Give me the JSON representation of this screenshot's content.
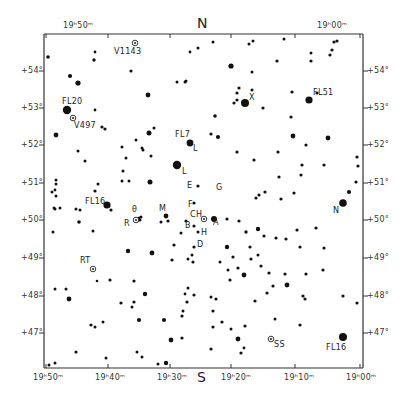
{
  "chart_data": {
    "type": "scatter",
    "frame": {
      "left": 44,
      "top": 34,
      "right": 363,
      "bottom": 368
    },
    "orientation": {
      "north": "N",
      "south": "S"
    },
    "ra_axis": {
      "label_top": [
        "19h50m",
        "19h00m"
      ],
      "ticks": [
        {
          "label": "19ʰ50ᵐ",
          "x": 46
        },
        {
          "label": "19ʰ40ᵐ",
          "x": 108
        },
        {
          "label": "19ʰ30ᵐ",
          "x": 170
        },
        {
          "label": "19ʰ20ᵐ",
          "x": 231
        },
        {
          "label": "19ʰ10ᵐ",
          "x": 295
        },
        {
          "label": "19ʰ00ᵐ",
          "x": 360
        }
      ]
    },
    "dec_axis": {
      "ticks": [
        {
          "label": "+54°",
          "y": 71
        },
        {
          "label": "+53°",
          "y": 108
        },
        {
          "label": "+52°",
          "y": 145
        },
        {
          "label": "+51°",
          "y": 183
        },
        {
          "label": "+50°",
          "y": 220
        },
        {
          "label": "+49°",
          "y": 258
        },
        {
          "label": "+48°",
          "y": 296
        },
        {
          "label": "+47°",
          "y": 333
        }
      ]
    },
    "labeled_objects": [
      {
        "name": "V1143",
        "type": "variable",
        "x": 135,
        "y": 43
      },
      {
        "name": "FL20",
        "type": "star",
        "x": 67,
        "y": 110
      },
      {
        "name": "V497",
        "type": "variable",
        "x": 73,
        "y": 118
      },
      {
        "name": "X",
        "type": "star",
        "x": 245,
        "y": 103
      },
      {
        "name": "FL51",
        "type": "star",
        "x": 309,
        "y": 100
      },
      {
        "name": "FL7",
        "type": "star",
        "x": 190,
        "y": 143
      },
      {
        "name": "L",
        "type": "star",
        "x": 177,
        "y": 165
      },
      {
        "name": "FL16",
        "type": "star",
        "x": 107,
        "y": 205
      },
      {
        "name": "E",
        "type": "star",
        "x": 195,
        "y": 183
      },
      {
        "name": "G",
        "type": "star",
        "x": 213,
        "y": 191
      },
      {
        "name": "θ",
        "type": "star",
        "x": 136,
        "y": 218
      },
      {
        "name": "R",
        "type": "variable",
        "x": 133,
        "y": 220
      },
      {
        "name": "M",
        "type": "star",
        "x": 166,
        "y": 216
      },
      {
        "name": "F",
        "type": "star",
        "x": 195,
        "y": 207
      },
      {
        "name": "CH",
        "type": "variable",
        "x": 204,
        "y": 219
      },
      {
        "name": "A",
        "type": "star",
        "x": 211,
        "y": 219
      },
      {
        "name": "B",
        "type": "star",
        "x": 192,
        "y": 223
      },
      {
        "name": "H",
        "type": "star",
        "x": 200,
        "y": 230
      },
      {
        "name": "D",
        "type": "star",
        "x": 194,
        "y": 248
      },
      {
        "name": "N",
        "type": "star",
        "x": 343,
        "y": 203
      },
      {
        "name": "RT",
        "type": "variable",
        "x": 93,
        "y": 269
      },
      {
        "name": "SS",
        "type": "variable",
        "x": 271,
        "y": 339
      },
      {
        "name": "FL16",
        "type": "star",
        "x": 343,
        "y": 337
      }
    ]
  },
  "labels": {
    "top_left_ra": "19ʰ50ᵐ",
    "top_right_ra": "19ʰ00ᵐ",
    "north": "N",
    "south": "S",
    "v1143": "V1143",
    "fl20": "FL20",
    "v497": "V497",
    "x": "X",
    "fl51": "FL51",
    "fl7": "FL7",
    "l1": "L",
    "l2": "L",
    "fl16_left": "FL16",
    "e": "E",
    "g": "G",
    "theta": "θ",
    "r": "R",
    "m": "M",
    "f": "F",
    "ch": "CH",
    "a": "A",
    "b": "B",
    "h": "H",
    "d": "D",
    "n": "N",
    "rt": "RT",
    "ss": "SS",
    "fl16_right": "FL16",
    "dec_left": [
      "+54°",
      "+53°",
      "+52°",
      "+51°",
      "+50°",
      "+49°",
      "+48°",
      "+47°"
    ],
    "dec_right": [
      "+54°",
      "+53°",
      "+52°",
      "+51°",
      "+50°",
      "+49°",
      "+48°",
      "+47°"
    ],
    "ra_bottom": [
      "19ʰ50ᵐ",
      "19ʰ40ᵐ",
      "19ʰ30ᵐ",
      "19ʰ20ᵐ",
      "19ʰ10ᵐ",
      "19ʰ00ᵐ"
    ]
  },
  "stars": [
    [
      48,
      57,
      1.8
    ],
    [
      95,
      52,
      1.4
    ],
    [
      94,
      60,
      1.7
    ],
    [
      70,
      76,
      2.1
    ],
    [
      78,
      83,
      2.6
    ],
    [
      95,
      110,
      1.4
    ],
    [
      56,
      135,
      2.4
    ],
    [
      102,
      127,
      1.6
    ],
    [
      105,
      129,
      1.6
    ],
    [
      149,
      133,
      2.5
    ],
    [
      154,
      128,
      1.5
    ],
    [
      131,
      71,
      1.6
    ],
    [
      186,
      81,
      1.5
    ],
    [
      190,
      52,
      1.4
    ],
    [
      198,
      48,
      1.5
    ],
    [
      177,
      82,
      1.5
    ],
    [
      185,
      82,
      1.5
    ],
    [
      148,
      95,
      2.4
    ],
    [
      213,
      42,
      1.5
    ],
    [
      249,
      44,
      1.5
    ],
    [
      252,
      72,
      1.5
    ],
    [
      239,
      88,
      1.6
    ],
    [
      231,
      66,
      2.6
    ],
    [
      237,
      93,
      1.6
    ],
    [
      234,
      103,
      1.6
    ],
    [
      237,
      100,
      1.6
    ],
    [
      263,
      108,
      1.6
    ],
    [
      252,
      90,
      1.5
    ],
    [
      215,
      116,
      1.8
    ],
    [
      211,
      134,
      1.6
    ],
    [
      292,
      92,
      1.6
    ],
    [
      291,
      117,
      1.6
    ],
    [
      311,
      53,
      1.5
    ],
    [
      317,
      93,
      1.6
    ],
    [
      332,
      50,
      1.6
    ],
    [
      334,
      42,
      1.6
    ],
    [
      337,
      41,
      1.6
    ],
    [
      330,
      55,
      1.6
    ],
    [
      311,
      61,
      1.6
    ],
    [
      277,
      61,
      1.6
    ],
    [
      284,
      39,
      1.5
    ],
    [
      253,
      41,
      1.5
    ],
    [
      218,
      137,
      2.1
    ],
    [
      293,
      136,
      2.4
    ],
    [
      328,
      138,
      2.4
    ],
    [
      306,
      145,
      1.6
    ],
    [
      278,
      152,
      1.6
    ],
    [
      302,
      165,
      1.6
    ],
    [
      301,
      175,
      1.6
    ],
    [
      324,
      165,
      1.6
    ],
    [
      357,
      157,
      1.6
    ],
    [
      358,
      166,
      1.6
    ],
    [
      356,
      182,
      1.6
    ],
    [
      349,
      192,
      2.1
    ],
    [
      279,
      177,
      1.6
    ],
    [
      281,
      199,
      1.6
    ],
    [
      294,
      193,
      1.6
    ],
    [
      259,
      195,
      1.6
    ],
    [
      265,
      192,
      1.6
    ],
    [
      256,
      198,
      1.6
    ],
    [
      254,
      160,
      1.6
    ],
    [
      237,
      152,
      1.6
    ],
    [
      56,
      180,
      1.5
    ],
    [
      56,
      184,
      1.5
    ],
    [
      55,
      190,
      1.4
    ],
    [
      56,
      196,
      1.5
    ],
    [
      54,
      208,
      1.5
    ],
    [
      52,
      192,
      1.5
    ],
    [
      55,
      209,
      1.5
    ],
    [
      53,
      232,
      1.5
    ],
    [
      60,
      208,
      1.5
    ],
    [
      76,
      209,
      1.5
    ],
    [
      80,
      210,
      1.5
    ],
    [
      79,
      222,
      1.8
    ],
    [
      93,
      231,
      1.5
    ],
    [
      98,
      184,
      1.5
    ],
    [
      95,
      191,
      1.6
    ],
    [
      111,
      210,
      1.6
    ],
    [
      122,
      181,
      1.5
    ],
    [
      129,
      181,
      1.5
    ],
    [
      123,
      171,
      1.5
    ],
    [
      85,
      161,
      1.5
    ],
    [
      78,
      151,
      1.5
    ],
    [
      122,
      147,
      1.5
    ],
    [
      126,
      158,
      1.5
    ],
    [
      136,
      140,
      1.5
    ],
    [
      143,
      150,
      1.5
    ],
    [
      151,
      156,
      1.5
    ],
    [
      142,
      148,
      1.5
    ],
    [
      150,
      182,
      2.5
    ],
    [
      137,
      220,
      2.4
    ],
    [
      139,
      218,
      1.5
    ],
    [
      141,
      217,
      1.5
    ],
    [
      140,
      220,
      1.5
    ],
    [
      161,
      222,
      1.5
    ],
    [
      166,
      216,
      2.4
    ],
    [
      168,
      221,
      1.6
    ],
    [
      174,
      245,
      1.6
    ],
    [
      181,
      233,
      1.5
    ],
    [
      186,
      221,
      1.6
    ],
    [
      194,
      226,
      1.6
    ],
    [
      198,
      232,
      1.5
    ],
    [
      198,
      186,
      1.6
    ],
    [
      194,
      203,
      1.6
    ],
    [
      194,
      247,
      1.6
    ],
    [
      192,
      255,
      1.5
    ],
    [
      128,
      251,
      2.2
    ],
    [
      152,
      253,
      2.4
    ],
    [
      172,
      260,
      1.6
    ],
    [
      188,
      259,
      1.5
    ],
    [
      227,
      219,
      1.6
    ],
    [
      239,
      221,
      1.6
    ],
    [
      246,
      232,
      1.7
    ],
    [
      258,
      229,
      2.2
    ],
    [
      264,
      236,
      1.6
    ],
    [
      276,
      238,
      1.6
    ],
    [
      286,
      239,
      1.6
    ],
    [
      297,
      230,
      1.6
    ],
    [
      316,
      228,
      1.6
    ],
    [
      324,
      248,
      1.6
    ],
    [
      300,
      247,
      1.6
    ],
    [
      250,
      247,
      1.6
    ],
    [
      251,
      259,
      1.6
    ],
    [
      227,
      247,
      2.2
    ],
    [
      233,
      257,
      1.6
    ],
    [
      220,
      262,
      1.5
    ],
    [
      238,
      268,
      1.6
    ],
    [
      261,
      266,
      1.6
    ],
    [
      258,
      255,
      1.5
    ],
    [
      228,
      270,
      1.5
    ],
    [
      230,
      280,
      1.6
    ],
    [
      244,
      275,
      2.4
    ],
    [
      269,
      273,
      1.6
    ],
    [
      273,
      286,
      1.6
    ],
    [
      285,
      274,
      1.6
    ],
    [
      306,
      274,
      1.6
    ],
    [
      323,
      270,
      1.6
    ],
    [
      343,
      296,
      1.6
    ],
    [
      357,
      303,
      1.6
    ],
    [
      287,
      285,
      2.4
    ],
    [
      303,
      296,
      1.6
    ],
    [
      305,
      299,
      1.6
    ],
    [
      255,
      301,
      1.6
    ],
    [
      55,
      289,
      1.5
    ],
    [
      66,
      289,
      1.5
    ],
    [
      97,
      281,
      1.3
    ],
    [
      110,
      280,
      1.6
    ],
    [
      134,
      281,
      1.6
    ],
    [
      145,
      294,
      2.2
    ],
    [
      134,
      302,
      1.6
    ],
    [
      132,
      307,
      1.5
    ],
    [
      121,
      303,
      1.6
    ],
    [
      69,
      299,
      2.4
    ],
    [
      91,
      325,
      1.6
    ],
    [
      95,
      327,
      1.5
    ],
    [
      103,
      322,
      1.5
    ],
    [
      139,
      320,
      2.1
    ],
    [
      164,
      320,
      2.1
    ],
    [
      182,
      316,
      1.6
    ],
    [
      183,
      311,
      1.5
    ],
    [
      187,
      302,
      1.6
    ],
    [
      188,
      288,
      1.5
    ],
    [
      194,
      295,
      1.6
    ],
    [
      185,
      294,
      1.4
    ],
    [
      193,
      262,
      1.6
    ],
    [
      182,
      338,
      1.6
    ],
    [
      171,
      340,
      2.4
    ],
    [
      213,
      327,
      1.6
    ],
    [
      231,
      329,
      1.5
    ],
    [
      238,
      339,
      2.4
    ],
    [
      213,
      311,
      1.6
    ],
    [
      211,
      297,
      1.5
    ],
    [
      216,
      299,
      1.6
    ],
    [
      222,
      322,
      1.6
    ],
    [
      245,
      326,
      1.6
    ],
    [
      275,
      319,
      1.5
    ],
    [
      300,
      325,
      1.6
    ],
    [
      211,
      349,
      1.6
    ],
    [
      241,
      353,
      1.6
    ],
    [
      76,
      352,
      1.6
    ],
    [
      106,
      358,
      1.5
    ],
    [
      137,
      352,
      1.5
    ],
    [
      142,
      357,
      1.5
    ],
    [
      166,
      363,
      2.2
    ],
    [
      158,
      364,
      1.5
    ],
    [
      244,
      348,
      1.4
    ],
    [
      55,
      363,
      1.5
    ],
    [
      49,
      365,
      1.5
    ],
    [
      267,
      293,
      1.6
    ]
  ],
  "big_stars": [
    [
      67,
      110,
      4.2
    ],
    [
      245,
      103,
      4.0
    ],
    [
      309,
      100,
      3.6
    ],
    [
      190,
      143,
      3.4
    ],
    [
      177,
      165,
      4.2
    ],
    [
      107,
      205,
      3.6
    ],
    [
      343,
      203,
      3.8
    ],
    [
      343,
      337,
      4.0
    ],
    [
      214,
      219,
      3.0
    ],
    [
      204,
      219,
      2.2
    ]
  ],
  "ring_stars": [
    [
      135,
      43
    ],
    [
      73,
      118
    ],
    [
      204,
      219
    ],
    [
      136,
      220
    ],
    [
      93,
      269
    ],
    [
      271,
      339
    ]
  ]
}
